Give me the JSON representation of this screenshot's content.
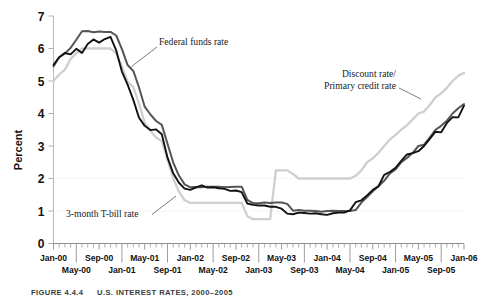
{
  "figure": {
    "caption_label": "FIGURE 4.4.4",
    "caption_title": "U.S. INTEREST RATES, 2000–2005"
  },
  "chart_data": {
    "type": "line",
    "title": "",
    "xlabel": "",
    "ylabel": "Percent",
    "ylim": [
      0,
      7
    ],
    "yticks": [
      0,
      1,
      2,
      3,
      4,
      5,
      6,
      7
    ],
    "ytick_labels": [
      "0",
      "1",
      "2",
      "3",
      "4",
      "5",
      "6",
      "7"
    ],
    "grid": false,
    "legend_position": "inline-annotations",
    "x_axis_tick_count": 73,
    "xtick_labels_row1": [
      "Jan-00",
      "Sep-00",
      "May-01",
      "Jan-02",
      "Sep-02",
      "May-03",
      "Jan-04",
      "Sep-04",
      "May-05",
      "Jan-06"
    ],
    "xtick_labels_row2": [
      "May-00",
      "Jan-01",
      "Sep-01",
      "May-02",
      "Jan-03",
      "Sep-03",
      "May-04",
      "Jan-05",
      "Sep-05"
    ],
    "xtick_labels_row1_index": [
      0,
      8,
      16,
      24,
      32,
      40,
      48,
      56,
      64,
      72
    ],
    "xtick_labels_row2_index": [
      4,
      12,
      20,
      28,
      36,
      44,
      52,
      60,
      68
    ],
    "annotations": [
      {
        "name": "federal-funds-rate",
        "text": "Federal funds rate",
        "lines": [
          "Federal funds rate"
        ]
      },
      {
        "name": "discount-rate",
        "text": "Discount rate/ Primary credit rate",
        "lines": [
          "Discount rate/",
          "Primary credit rate"
        ]
      },
      {
        "name": "t-bill-rate",
        "text": "3-month T-bill rate",
        "lines": [
          "3-month T-bill rate"
        ]
      }
    ],
    "series": [
      {
        "name": "Federal funds rate",
        "color": "#555555",
        "values": [
          5.45,
          5.73,
          5.85,
          6.02,
          6.27,
          6.53,
          6.54,
          6.5,
          6.52,
          6.51,
          6.51,
          6.4,
          5.98,
          5.49,
          5.31,
          4.8,
          4.21,
          3.97,
          3.77,
          3.65,
          3.07,
          2.49,
          2.09,
          1.82,
          1.73,
          1.74,
          1.73,
          1.75,
          1.75,
          1.75,
          1.73,
          1.74,
          1.75,
          1.75,
          1.34,
          1.24,
          1.24,
          1.26,
          1.25,
          1.26,
          1.26,
          1.22,
          1.01,
          1.03,
          1.01,
          1.01,
          1.0,
          0.98,
          1.0,
          1.01,
          1.0,
          1.0,
          1.0,
          1.03,
          1.26,
          1.43,
          1.61,
          1.76,
          1.93,
          2.16,
          2.28,
          2.5,
          2.63,
          2.79,
          3.0,
          3.04,
          3.26,
          3.5,
          3.62,
          3.78,
          4.0,
          4.16,
          4.29
        ],
        "style": "solid"
      },
      {
        "name": "3-month T-bill rate",
        "color": "#111111",
        "values": [
          5.5,
          5.73,
          5.86,
          5.82,
          5.99,
          5.86,
          6.14,
          6.28,
          6.18,
          6.29,
          6.36,
          5.94,
          5.29,
          4.89,
          4.42,
          3.87,
          3.62,
          3.49,
          3.51,
          3.36,
          2.64,
          2.16,
          1.87,
          1.69,
          1.65,
          1.73,
          1.79,
          1.72,
          1.73,
          1.7,
          1.68,
          1.62,
          1.63,
          1.58,
          1.23,
          1.19,
          1.17,
          1.17,
          1.13,
          1.13,
          1.07,
          0.92,
          0.9,
          0.95,
          0.94,
          0.92,
          0.93,
          0.9,
          0.88,
          0.93,
          0.95,
          0.95,
          1.02,
          1.27,
          1.33,
          1.48,
          1.65,
          1.76,
          2.11,
          2.2,
          2.33,
          2.54,
          2.74,
          2.78,
          2.84,
          3.0,
          3.22,
          3.44,
          3.42,
          3.71,
          3.89,
          3.88,
          4.24
        ],
        "style": "solid"
      },
      {
        "name": "Discount rate/Primary credit rate",
        "color": "#cfcfcf",
        "values": [
          5.0,
          5.2,
          5.35,
          5.68,
          5.85,
          6.0,
          6.0,
          6.0,
          6.0,
          6.0,
          6.0,
          5.85,
          5.44,
          4.97,
          4.81,
          4.3,
          3.72,
          3.47,
          3.26,
          3.15,
          2.58,
          2.0,
          1.6,
          1.33,
          1.25,
          1.25,
          1.25,
          1.25,
          1.25,
          1.25,
          1.25,
          1.25,
          1.25,
          1.25,
          0.84,
          0.75,
          0.75,
          0.75,
          0.75,
          2.25,
          2.25,
          2.25,
          2.14,
          2.0,
          2.0,
          2.0,
          2.0,
          2.0,
          2.0,
          2.0,
          2.0,
          2.0,
          2.0,
          2.08,
          2.25,
          2.5,
          2.62,
          2.79,
          3.0,
          3.2,
          3.34,
          3.5,
          3.64,
          3.82,
          4.0,
          4.06,
          4.26,
          4.5,
          4.62,
          4.79,
          5.0,
          5.16,
          5.25
        ],
        "style": "solid"
      }
    ]
  }
}
